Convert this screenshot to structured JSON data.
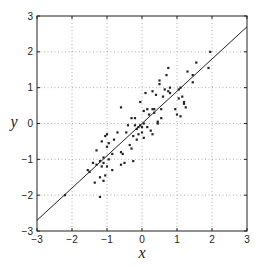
{
  "chart_data": {
    "type": "scatter",
    "title": "",
    "xlabel": "x",
    "ylabel": "y",
    "xlim": [
      -3,
      3
    ],
    "ylim": [
      -3,
      3
    ],
    "xticks": [
      -3,
      -2,
      -1,
      0,
      1,
      2,
      3
    ],
    "yticks": [
      -3,
      -2,
      -1,
      0,
      1,
      2,
      3
    ],
    "xtick_labels": [
      "−3",
      "−2",
      "−1",
      "0",
      "1",
      "2",
      "3"
    ],
    "ytick_labels": [
      "−3",
      "−2",
      "−1",
      "0",
      "1",
      "2",
      "3"
    ],
    "grid": true,
    "grid_style": "dotted",
    "legend": null,
    "colors": {
      "points": "#222222",
      "line": "#222222",
      "grid": "#999999",
      "axes": "#222222"
    },
    "fit_line": {
      "slope": 0.9,
      "intercept": 0.0,
      "x_range": [
        -3,
        3
      ]
    },
    "series": [
      {
        "name": "data",
        "points": [
          [
            1.95,
            2.0
          ],
          [
            1.9,
            1.55
          ],
          [
            1.55,
            1.7
          ],
          [
            1.45,
            1.35
          ],
          [
            1.45,
            1.15
          ],
          [
            1.3,
            1.45
          ],
          [
            1.25,
            0.45
          ],
          [
            1.2,
            0.6
          ],
          [
            1.2,
            0.55
          ],
          [
            1.15,
            0.75
          ],
          [
            1.1,
            1.0
          ],
          [
            1.1,
            0.2
          ],
          [
            1.05,
            0.95
          ],
          [
            1.05,
            0.7
          ],
          [
            1.0,
            0.25
          ],
          [
            0.95,
            0.4
          ],
          [
            0.8,
            1.0
          ],
          [
            0.8,
            0.85
          ],
          [
            0.75,
            1.55
          ],
          [
            0.75,
            0.9
          ],
          [
            0.7,
            1.35
          ],
          [
            0.65,
            0.95
          ],
          [
            0.6,
            0.75
          ],
          [
            0.55,
            0.4
          ],
          [
            0.55,
            0.15
          ],
          [
            0.5,
            1.2
          ],
          [
            0.5,
            1.1
          ],
          [
            0.45,
            0.05
          ],
          [
            0.45,
            0.0
          ],
          [
            0.4,
            0.8
          ],
          [
            0.35,
            0.4
          ],
          [
            0.35,
            0.3
          ],
          [
            0.3,
            0.9
          ],
          [
            0.3,
            0.4
          ],
          [
            0.3,
            -0.3
          ],
          [
            0.25,
            -0.2
          ],
          [
            0.2,
            0.25
          ],
          [
            0.15,
            0.4
          ],
          [
            0.15,
            -0.1
          ],
          [
            0.1,
            0.85
          ],
          [
            0.05,
            0.35
          ],
          [
            0.05,
            0.0
          ],
          [
            0.05,
            -0.4
          ],
          [
            0.0,
            -0.1
          ],
          [
            0.0,
            -0.25
          ],
          [
            -0.05,
            0.6
          ],
          [
            -0.05,
            -0.05
          ],
          [
            -0.1,
            -0.1
          ],
          [
            -0.1,
            -0.3
          ],
          [
            -0.15,
            -0.15
          ],
          [
            -0.15,
            -0.45
          ],
          [
            -0.2,
            0.15
          ],
          [
            -0.2,
            -0.05
          ],
          [
            -0.25,
            -0.35
          ],
          [
            -0.25,
            -1.05
          ],
          [
            -0.3,
            0.15
          ],
          [
            -0.3,
            -0.7
          ],
          [
            -0.35,
            -0.6
          ],
          [
            -0.4,
            -0.05
          ],
          [
            -0.45,
            -0.25
          ],
          [
            -0.5,
            -1.1
          ],
          [
            -0.55,
            -0.85
          ],
          [
            -0.6,
            0.45
          ],
          [
            -0.6,
            -0.8
          ],
          [
            -0.6,
            -1.15
          ],
          [
            -0.7,
            -0.25
          ],
          [
            -0.8,
            -0.45
          ],
          [
            -0.85,
            -0.85
          ],
          [
            -0.85,
            -1.3
          ],
          [
            -0.95,
            -0.55
          ],
          [
            -0.95,
            -1.0
          ],
          [
            -1.0,
            -0.3
          ],
          [
            -1.0,
            -0.65
          ],
          [
            -1.0,
            -1.2
          ],
          [
            -1.05,
            -0.35
          ],
          [
            -1.05,
            -1.45
          ],
          [
            -1.1,
            -0.95
          ],
          [
            -1.1,
            -1.1
          ],
          [
            -1.1,
            -1.6
          ],
          [
            -1.15,
            -0.5
          ],
          [
            -1.15,
            -1.2
          ],
          [
            -1.2,
            -1.05
          ],
          [
            -1.2,
            -1.5
          ],
          [
            -1.2,
            -2.05
          ],
          [
            -1.3,
            -0.75
          ],
          [
            -1.3,
            -1.15
          ],
          [
            -1.35,
            -1.65
          ],
          [
            -1.4,
            -1.1
          ],
          [
            -1.5,
            -1.35
          ],
          [
            -1.55,
            -1.3
          ],
          [
            -2.2,
            -2.0
          ]
        ]
      }
    ]
  }
}
